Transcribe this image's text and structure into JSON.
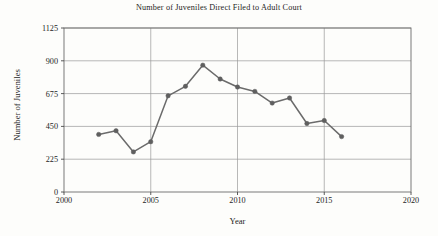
{
  "chart_data": {
    "type": "line",
    "title": "Number of Juveniles Direct Filed to Adult Court",
    "xlabel": "Year",
    "ylabel": "Number of Juveniles",
    "xlim": [
      2000,
      2020
    ],
    "ylim": [
      0,
      1125
    ],
    "xticks": [
      2000,
      2005,
      2010,
      2015,
      2020
    ],
    "yticks": [
      0,
      225,
      450,
      675,
      900,
      1125
    ],
    "grid": true,
    "legend": null,
    "marker": "circle",
    "line_color": "#6b6b6b",
    "marker_color": "#5f5f5f",
    "x": [
      2002,
      2003,
      2004,
      2005,
      2006,
      2007,
      2008,
      2009,
      2010,
      2011,
      2012,
      2013,
      2014,
      2015,
      2016
    ],
    "values": [
      395,
      420,
      275,
      345,
      660,
      725,
      870,
      775,
      720,
      690,
      610,
      645,
      470,
      490,
      380
    ],
    "series": [
      {
        "name": "Juveniles Direct Filed",
        "values": [
          395,
          420,
          275,
          345,
          660,
          725,
          870,
          775,
          720,
          690,
          610,
          645,
          470,
          490,
          380
        ]
      }
    ]
  }
}
